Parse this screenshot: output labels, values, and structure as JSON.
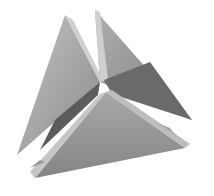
{
  "image": {
    "subject": "Interlocking triangular planes (3D tetrahedral render)",
    "palette": {
      "background": "#ffffff",
      "light_face": "#b8b8b8",
      "mid_face": "#9a9a9a",
      "dark_face": "#5e5e5e",
      "edge_highlight": "#d6d6d6",
      "shadow": "#3c3c3c"
    }
  }
}
